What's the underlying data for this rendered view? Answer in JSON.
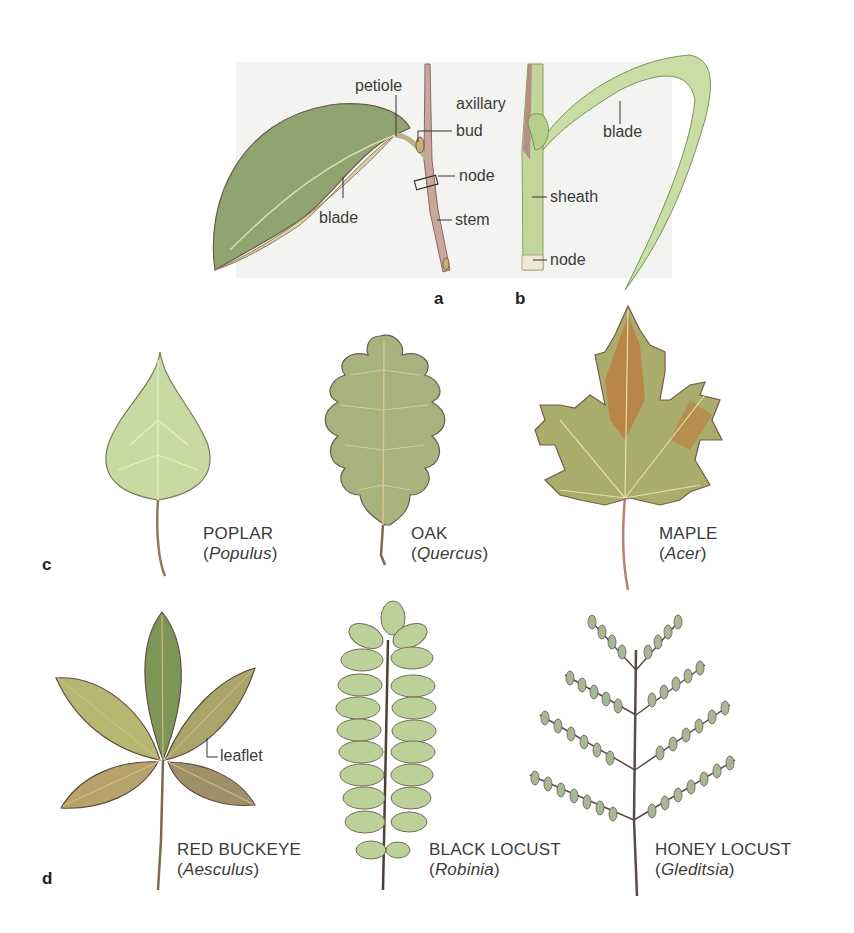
{
  "panels": {
    "a": {
      "letter": "a",
      "labels": {
        "petiole": "petiole",
        "axillary": "axillary",
        "bud": "bud",
        "node": "node",
        "stem": "stem",
        "blade": "blade"
      }
    },
    "b": {
      "letter": "b",
      "labels": {
        "blade": "blade",
        "sheath": "sheath",
        "node": "node"
      }
    },
    "c": {
      "letter": "c",
      "leaves": [
        {
          "common": "POPLAR",
          "open": "(",
          "genus": "Populus",
          "close": ")"
        },
        {
          "common": "OAK",
          "open": "(",
          "genus": "Quercus",
          "close": ")"
        },
        {
          "common": "MAPLE",
          "open": "(",
          "genus": "Acer",
          "close": ")"
        }
      ]
    },
    "d": {
      "letter": "d",
      "leaflet_label": "leaflet",
      "leaves": [
        {
          "common": "RED BUCKEYE",
          "open": "(",
          "genus": "Aesculus",
          "close": ")"
        },
        {
          "common": "BLACK LOCUST",
          "open": "(",
          "genus": "Robinia",
          "close": ")"
        },
        {
          "common": "HONEY LOCUST",
          "open": "(",
          "genus": "Gleditsia",
          "close": ")"
        }
      ]
    }
  },
  "colors": {
    "panel_bg": "#f3f4f1",
    "leaf_green": "#a9bd7c",
    "leaf_dark": "#6f7d55",
    "stem_brown": "#b58f84",
    "grass_green": "#bcd39a",
    "maple_orange": "#c07a3c"
  }
}
